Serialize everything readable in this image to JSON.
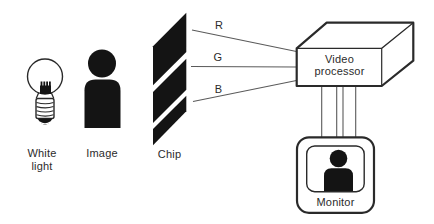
{
  "diagram": {
    "title_semantic": "RGB video capture diagram",
    "labels": {
      "white_light_line1": "White",
      "white_light_line2": "light",
      "image": "Image",
      "chip": "Chip",
      "r": "R",
      "g": "G",
      "b": "B",
      "video_processor_line1": "Video",
      "video_processor_line2": "processor",
      "monitor": "Monitor"
    },
    "icons": [
      "light-bulb-icon",
      "person-icon",
      "chip-icon",
      "video-processor-box-icon",
      "monitor-icon"
    ],
    "colors": {
      "background": "#ffffff",
      "ink_fill": "#141414",
      "outline": "#2a2a2a",
      "thin_line": "#5a5a5a",
      "text": "#2b2b2b"
    }
  }
}
